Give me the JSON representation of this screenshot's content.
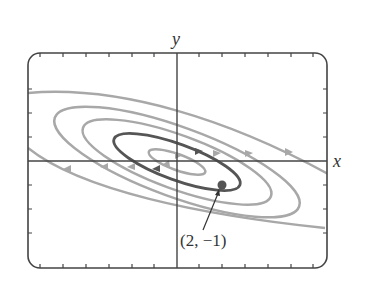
{
  "diagram": {
    "type": "phase-plane",
    "axes": {
      "x_label": "x",
      "y_label": "y",
      "x_ticks": [
        -6,
        -5,
        -4,
        -3,
        -2,
        -1,
        1,
        2,
        3,
        4,
        5,
        6
      ],
      "y_ticks": [
        -4,
        -3,
        -2,
        -1,
        1,
        2,
        3,
        4
      ]
    },
    "highlighted_point": {
      "label": "(2, −1)",
      "x": 2,
      "y": -1
    },
    "trajectories": [
      {
        "name": "inner-orbit",
        "color": "#a8a8a8"
      },
      {
        "name": "solution-through-point",
        "color": "#555555"
      },
      {
        "name": "orbit-3",
        "color": "#a8a8a8"
      },
      {
        "name": "orbit-4",
        "color": "#a8a8a8"
      },
      {
        "name": "outer-orbit",
        "color": "#a8a8a8"
      }
    ],
    "colors": {
      "frame": "#444444",
      "highlight": "#555555",
      "trajectory": "#a8a8a8"
    }
  }
}
